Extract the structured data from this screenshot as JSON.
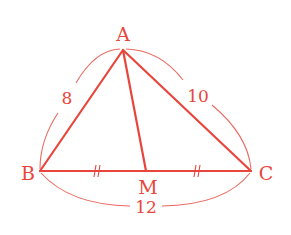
{
  "diagram": {
    "type": "triangle-with-median",
    "color": "#e8463c",
    "arc_color": "#ea6a60",
    "vertices": {
      "A": {
        "label": "A",
        "x": 123,
        "y": 50,
        "label_x": 123,
        "label_y": 34
      },
      "B": {
        "label": "B",
        "x": 40,
        "y": 171,
        "label_x": 28,
        "label_y": 173
      },
      "C": {
        "label": "C",
        "x": 251,
        "y": 171,
        "label_x": 266,
        "label_y": 173
      },
      "M": {
        "label": "M",
        "x": 146,
        "y": 171,
        "label_x": 148,
        "label_y": 187
      }
    },
    "segments": [
      {
        "name": "AB",
        "from": "A",
        "to": "B"
      },
      {
        "name": "AC",
        "from": "A",
        "to": "C"
      },
      {
        "name": "BC",
        "from": "B",
        "to": "C"
      },
      {
        "name": "AM",
        "from": "A",
        "to": "M",
        "role": "median"
      }
    ],
    "lengths": {
      "AB": "8",
      "AC": "10",
      "BC": "12"
    },
    "equal_marks": {
      "BM": "//",
      "MC": "//"
    }
  }
}
